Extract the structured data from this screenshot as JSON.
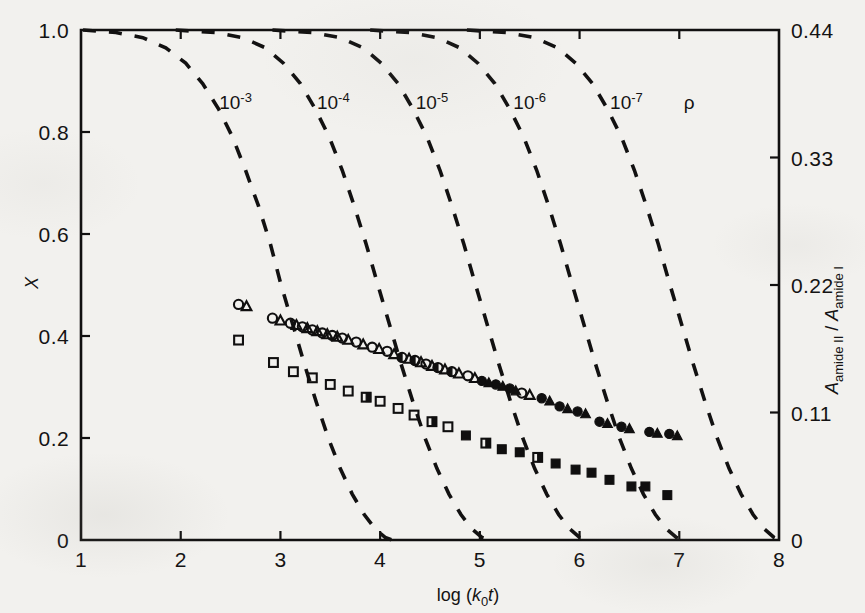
{
  "figure": {
    "background_color": "#f2f1ee",
    "ink_color": "#121111"
  },
  "chart_data": {
    "type": "scatter",
    "title": "",
    "subtitle": "",
    "xlabel": "log (k0t)",
    "xlabel_parts": {
      "prefix": "log (",
      "k": "k",
      "sub": "0",
      "t": "t",
      "suffix": ")"
    },
    "ylabel": "X",
    "ylabel_right": "Aamide II / Aamide I",
    "ylabel_right_parts": {
      "a1": "A",
      "sub1": "amide II",
      "slash": "/",
      "a2": "A",
      "sub2": "amide I"
    },
    "xlim": [
      1,
      8
    ],
    "ylim": [
      0,
      1
    ],
    "ylim_right": [
      0,
      0.44
    ],
    "grid": false,
    "legend": "none",
    "xticks": [
      1,
      2,
      3,
      4,
      5,
      6,
      7,
      8
    ],
    "xticklabels": [
      "1",
      "2",
      "3",
      "4",
      "5",
      "6",
      "7",
      "8"
    ],
    "yticks": [
      0,
      0.2,
      0.4,
      0.6,
      0.8,
      1.0
    ],
    "yticklabels": [
      "0",
      "0.2",
      "0.4",
      "0.6",
      "0.8",
      "1.0"
    ],
    "yticks_right": [
      0,
      0.11,
      0.22,
      0.33,
      0.44
    ],
    "yticklabels_right": [
      "0",
      "0.11",
      "0.22",
      "0.33",
      "0.44"
    ],
    "annotations": [
      {
        "text_parts": {
          "base": "10",
          "exp": "-3"
        },
        "x": 2.55,
        "y": 0.845
      },
      {
        "text_parts": {
          "base": "10",
          "exp": "-4"
        },
        "x": 3.53,
        "y": 0.845
      },
      {
        "text_parts": {
          "base": "10",
          "exp": "-5"
        },
        "x": 4.52,
        "y": 0.845
      },
      {
        "text_parts": {
          "base": "10",
          "exp": "-6"
        },
        "x": 5.5,
        "y": 0.845
      },
      {
        "text_parts": {
          "base": "10",
          "exp": "-7"
        },
        "x": 6.47,
        "y": 0.845
      },
      {
        "text_parts": {
          "base": "ρ",
          "exp": ""
        },
        "x": 7.1,
        "y": 0.845
      }
    ],
    "curves": [
      {
        "name": "rho = 1e-3",
        "label": "10^-3",
        "style": "dashed",
        "midpoint_x": 2.92,
        "points": [
          [
            1.02,
            1.0
          ],
          [
            1.35,
            0.995
          ],
          [
            1.62,
            0.985
          ],
          [
            1.85,
            0.965
          ],
          [
            2.05,
            0.935
          ],
          [
            2.22,
            0.895
          ],
          [
            2.38,
            0.845
          ],
          [
            2.52,
            0.79
          ],
          [
            2.65,
            0.725
          ],
          [
            2.78,
            0.655
          ],
          [
            2.9,
            0.58
          ],
          [
            3.0,
            0.505
          ],
          [
            3.12,
            0.425
          ],
          [
            3.24,
            0.345
          ],
          [
            3.36,
            0.27
          ],
          [
            3.48,
            0.2
          ],
          [
            3.6,
            0.14
          ],
          [
            3.72,
            0.09
          ],
          [
            3.84,
            0.05
          ],
          [
            3.95,
            0.022
          ],
          [
            4.05,
            0.005
          ],
          [
            4.12,
            0.0
          ]
        ]
      },
      {
        "name": "rho = 1e-4",
        "label": "10^-4",
        "style": "dashed",
        "midpoint_x": 3.88,
        "points": [
          [
            1.95,
            1.0
          ],
          [
            2.35,
            0.995
          ],
          [
            2.62,
            0.985
          ],
          [
            2.85,
            0.965
          ],
          [
            3.03,
            0.935
          ],
          [
            3.2,
            0.895
          ],
          [
            3.35,
            0.845
          ],
          [
            3.49,
            0.79
          ],
          [
            3.62,
            0.725
          ],
          [
            3.74,
            0.655
          ],
          [
            3.86,
            0.58
          ],
          [
            3.97,
            0.505
          ],
          [
            4.09,
            0.425
          ],
          [
            4.21,
            0.345
          ],
          [
            4.33,
            0.27
          ],
          [
            4.45,
            0.2
          ],
          [
            4.57,
            0.14
          ],
          [
            4.69,
            0.09
          ],
          [
            4.81,
            0.05
          ],
          [
            4.92,
            0.022
          ],
          [
            5.02,
            0.005
          ],
          [
            5.1,
            0.0
          ]
        ]
      },
      {
        "name": "rho = 1e-5",
        "label": "10^-5",
        "style": "dashed",
        "midpoint_x": 4.86,
        "points": [
          [
            2.92,
            1.0
          ],
          [
            3.32,
            0.995
          ],
          [
            3.6,
            0.985
          ],
          [
            3.83,
            0.965
          ],
          [
            4.01,
            0.935
          ],
          [
            4.18,
            0.895
          ],
          [
            4.33,
            0.845
          ],
          [
            4.47,
            0.79
          ],
          [
            4.6,
            0.725
          ],
          [
            4.72,
            0.655
          ],
          [
            4.84,
            0.58
          ],
          [
            4.95,
            0.505
          ],
          [
            5.07,
            0.425
          ],
          [
            5.19,
            0.345
          ],
          [
            5.31,
            0.27
          ],
          [
            5.43,
            0.2
          ],
          [
            5.55,
            0.14
          ],
          [
            5.67,
            0.09
          ],
          [
            5.79,
            0.05
          ],
          [
            5.9,
            0.022
          ],
          [
            6.0,
            0.005
          ],
          [
            6.08,
            0.0
          ]
        ]
      },
      {
        "name": "rho = 1e-6",
        "label": "10^-6",
        "style": "dashed",
        "midpoint_x": 5.83,
        "points": [
          [
            3.9,
            1.0
          ],
          [
            4.3,
            0.995
          ],
          [
            4.57,
            0.985
          ],
          [
            4.8,
            0.965
          ],
          [
            4.98,
            0.935
          ],
          [
            5.15,
            0.895
          ],
          [
            5.3,
            0.845
          ],
          [
            5.44,
            0.79
          ],
          [
            5.57,
            0.725
          ],
          [
            5.69,
            0.655
          ],
          [
            5.81,
            0.58
          ],
          [
            5.92,
            0.505
          ],
          [
            6.04,
            0.425
          ],
          [
            6.16,
            0.345
          ],
          [
            6.28,
            0.27
          ],
          [
            6.4,
            0.2
          ],
          [
            6.52,
            0.14
          ],
          [
            6.64,
            0.09
          ],
          [
            6.76,
            0.05
          ],
          [
            6.87,
            0.022
          ],
          [
            6.97,
            0.005
          ],
          [
            7.05,
            0.0
          ]
        ]
      },
      {
        "name": "rho = 1e-7",
        "label": "10^-7",
        "style": "dashed",
        "midpoint_x": 6.8,
        "points": [
          [
            4.87,
            1.0
          ],
          [
            5.27,
            0.995
          ],
          [
            5.55,
            0.985
          ],
          [
            5.78,
            0.965
          ],
          [
            5.96,
            0.935
          ],
          [
            6.13,
            0.895
          ],
          [
            6.28,
            0.845
          ],
          [
            6.42,
            0.79
          ],
          [
            6.55,
            0.725
          ],
          [
            6.67,
            0.655
          ],
          [
            6.79,
            0.58
          ],
          [
            6.9,
            0.505
          ],
          [
            7.02,
            0.425
          ],
          [
            7.14,
            0.345
          ],
          [
            7.26,
            0.27
          ],
          [
            7.38,
            0.2
          ],
          [
            7.5,
            0.14
          ],
          [
            7.62,
            0.09
          ],
          [
            7.74,
            0.05
          ],
          [
            7.85,
            0.022
          ],
          [
            7.95,
            0.005
          ],
          [
            8.0,
            0.0
          ]
        ]
      }
    ],
    "series": [
      {
        "name": "open-circle-to-filled-circle",
        "marker": "circle",
        "points": [
          [
            2.58,
            0.462,
            "open"
          ],
          [
            2.92,
            0.435,
            "open"
          ],
          [
            3.1,
            0.425,
            "open"
          ],
          [
            3.22,
            0.418,
            "open"
          ],
          [
            3.32,
            0.412,
            "open"
          ],
          [
            3.42,
            0.406,
            "open"
          ],
          [
            3.52,
            0.401,
            "open"
          ],
          [
            3.62,
            0.396,
            "open"
          ],
          [
            3.76,
            0.388,
            "open"
          ],
          [
            3.92,
            0.378,
            "open"
          ],
          [
            4.07,
            0.37,
            "open"
          ],
          [
            4.22,
            0.358,
            "half"
          ],
          [
            4.35,
            0.352,
            "half"
          ],
          [
            4.46,
            0.345,
            "open"
          ],
          [
            4.58,
            0.338,
            "half"
          ],
          [
            4.72,
            0.33,
            "half"
          ],
          [
            4.88,
            0.322,
            "open"
          ],
          [
            5.02,
            0.312,
            "fill"
          ],
          [
            5.16,
            0.305,
            "fill"
          ],
          [
            5.3,
            0.297,
            "fill"
          ],
          [
            5.42,
            0.288,
            "open"
          ],
          [
            5.62,
            0.278,
            "fill"
          ],
          [
            5.8,
            0.262,
            "fill"
          ],
          [
            5.98,
            0.252,
            "fill"
          ],
          [
            6.2,
            0.232,
            "fill"
          ],
          [
            6.42,
            0.222,
            "fill"
          ],
          [
            6.7,
            0.212,
            "fill"
          ],
          [
            6.9,
            0.208,
            "fill"
          ]
        ]
      },
      {
        "name": "open-triangle-to-filled-triangle",
        "marker": "triangle",
        "points": [
          [
            2.66,
            0.458,
            "open"
          ],
          [
            3.0,
            0.43,
            "open"
          ],
          [
            3.16,
            0.421,
            "open"
          ],
          [
            3.27,
            0.415,
            "open"
          ],
          [
            3.37,
            0.409,
            "open"
          ],
          [
            3.47,
            0.403,
            "open"
          ],
          [
            3.57,
            0.398,
            "open"
          ],
          [
            3.68,
            0.392,
            "open"
          ],
          [
            3.83,
            0.383,
            "open"
          ],
          [
            3.99,
            0.374,
            "open"
          ],
          [
            4.14,
            0.364,
            "open"
          ],
          [
            4.29,
            0.355,
            "open"
          ],
          [
            4.41,
            0.348,
            "open"
          ],
          [
            4.52,
            0.341,
            "open"
          ],
          [
            4.65,
            0.334,
            "open"
          ],
          [
            4.79,
            0.326,
            "open"
          ],
          [
            4.95,
            0.317,
            "open"
          ],
          [
            5.09,
            0.308,
            "fill"
          ],
          [
            5.23,
            0.301,
            "fill"
          ],
          [
            5.36,
            0.292,
            "fill"
          ],
          [
            5.5,
            0.284,
            "open"
          ],
          [
            5.7,
            0.272,
            "fill"
          ],
          [
            5.88,
            0.257,
            "fill"
          ],
          [
            6.06,
            0.247,
            "fill"
          ],
          [
            6.28,
            0.228,
            "fill"
          ],
          [
            6.5,
            0.218,
            "fill"
          ],
          [
            6.78,
            0.209,
            "fill"
          ],
          [
            6.98,
            0.204,
            "fill"
          ]
        ]
      },
      {
        "name": "open-square-to-filled-square",
        "marker": "square",
        "points": [
          [
            2.58,
            0.392,
            "open"
          ],
          [
            2.93,
            0.348,
            "open"
          ],
          [
            3.13,
            0.33,
            "open"
          ],
          [
            3.32,
            0.318,
            "open"
          ],
          [
            3.5,
            0.305,
            "open"
          ],
          [
            3.68,
            0.292,
            "open"
          ],
          [
            3.86,
            0.28,
            "half"
          ],
          [
            4.0,
            0.272,
            "open"
          ],
          [
            4.18,
            0.258,
            "open"
          ],
          [
            4.34,
            0.245,
            "open"
          ],
          [
            4.52,
            0.232,
            "half"
          ],
          [
            4.68,
            0.222,
            "open"
          ],
          [
            4.86,
            0.205,
            "fill"
          ],
          [
            5.06,
            0.19,
            "half"
          ],
          [
            5.22,
            0.178,
            "fill"
          ],
          [
            5.4,
            0.172,
            "fill"
          ],
          [
            5.58,
            0.162,
            "half"
          ],
          [
            5.76,
            0.15,
            "fill"
          ],
          [
            5.96,
            0.138,
            "fill"
          ],
          [
            6.12,
            0.132,
            "fill"
          ],
          [
            6.3,
            0.118,
            "fill"
          ],
          [
            6.52,
            0.105,
            "fill"
          ],
          [
            6.66,
            0.105,
            "fill"
          ],
          [
            6.88,
            0.088,
            "fill"
          ]
        ]
      }
    ]
  }
}
